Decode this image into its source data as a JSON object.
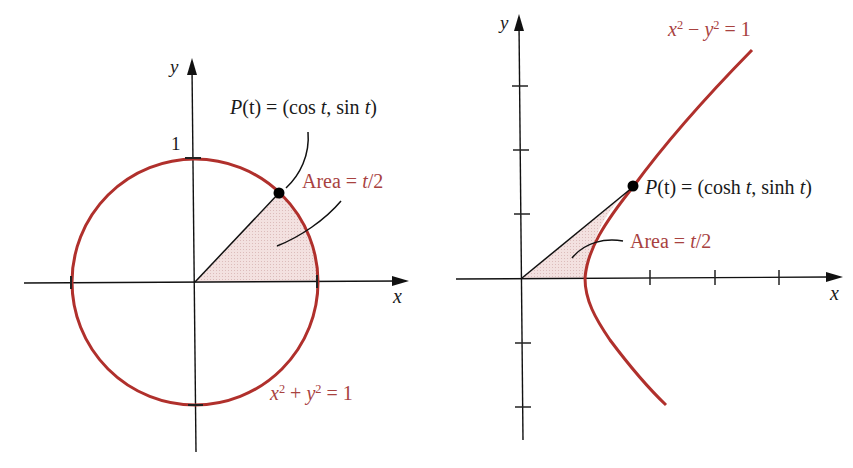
{
  "colors": {
    "curve": "#b0302c",
    "label_red": "#a8423f",
    "shade": "#f0dcdc",
    "axis": "#111111"
  },
  "left_figure": {
    "y_axis_label": "y",
    "x_axis_label": "x",
    "tick_label_one": "1",
    "point_label": "P(t) = (cos t, sin t)",
    "point_label_parts": {
      "P": "P",
      "t1": "(t)",
      "eq": " = (cos ",
      "t2": "t",
      "mid": ", sin ",
      "t3": "t",
      "close": ")"
    },
    "area_label": "Area = t/2",
    "area_parts": {
      "pre": "Area = ",
      "t": "t",
      "post": "/2"
    },
    "equation": "x² + y² = 1",
    "equation_parts": {
      "x": "x",
      "xe": "2",
      "op": " + ",
      "y": "y",
      "ye": "2",
      "rhs": " = 1"
    }
  },
  "right_figure": {
    "y_axis_label": "y",
    "x_axis_label": "x",
    "point_label": "P(t) = (cosh t, sinh t)",
    "point_label_parts": {
      "P": "P",
      "t1": "(t)",
      "eq": " = (cosh ",
      "t2": "t",
      "mid": ", sinh ",
      "t3": "t",
      "close": ")"
    },
    "area_label": "Area = t/2",
    "area_parts": {
      "pre": "Area = ",
      "t": "t",
      "post": "/2"
    },
    "equation": "x² − y² = 1",
    "equation_parts": {
      "x": "x",
      "xe": "2",
      "op": " − ",
      "y": "y",
      "ye": "2",
      "rhs": " = 1"
    }
  }
}
